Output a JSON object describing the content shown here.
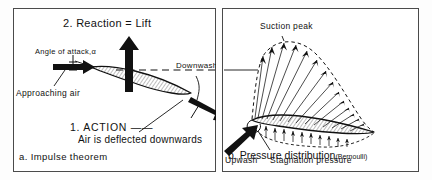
{
  "figure": {
    "background_color": "#ffffff",
    "line_color": "#111111",
    "frame_color": "#4a4a4a"
  },
  "panel_a": {
    "caption": "a. Impulse theorem",
    "labels": {
      "reaction": "2. Reaction = Lift",
      "angle_of_attack": "Angle of attack,α",
      "approaching_air": "Approaching air",
      "downwash": "Downwash",
      "action": "1. ACTION ——",
      "action_sub": "Air is deflected downwards"
    },
    "icons": {
      "lift_arrow": "up-arrow-icon",
      "approach_arrow": "right-arrow-icon",
      "downwash_arrow": "down-right-arrow-icon",
      "airfoil": "airfoil-shape-icon",
      "chord_line": "dashed-chord-line-icon",
      "angle_tick": "angle-tick-icon",
      "leader_line": "leader-line-icon"
    }
  },
  "panel_b": {
    "caption_main": "b. Pressure distribution",
    "caption_paren": "(Bernoulli)",
    "labels": {
      "suction_peak": "Suction peak",
      "upwash": "Upwash",
      "stagnation_pressure": "Stagnation pressure"
    },
    "icons": {
      "airfoil": "airfoil-shape-icon",
      "pressure_vectors": "pressure-vector-field-icon",
      "suction_envelope": "dashed-envelope-icon",
      "upwash_arrow": "up-right-arrow-icon",
      "leader_line": "leader-line-icon"
    }
  }
}
